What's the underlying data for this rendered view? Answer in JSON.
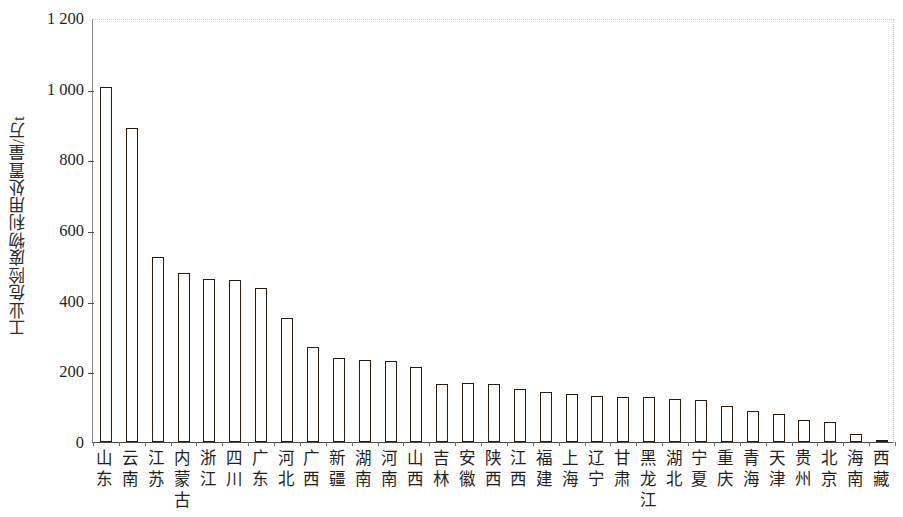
{
  "chart_data": {
    "type": "bar",
    "title": "",
    "subtitle": "",
    "xlabel": "",
    "ylabel": "工业危险废物利用处置量/万t",
    "ylim": [
      0,
      1200
    ],
    "ytick_labels": [
      "0",
      "200",
      "400",
      "600",
      "800",
      "1 000",
      "1 200"
    ],
    "ytick_values": [
      0,
      200,
      400,
      600,
      800,
      1000,
      1200
    ],
    "grid": false,
    "legend": null,
    "bar_color": "#e8933c",
    "bar_edge_color": "#2a1a0c",
    "categories": [
      "山东",
      "云南",
      "江苏",
      "内蒙古",
      "浙江",
      "四川",
      "广东",
      "河北",
      "广西",
      "新疆",
      "湖南",
      "河南",
      "山西",
      "吉林",
      "安徽",
      "陕西",
      "江西",
      "福建",
      "上海",
      "辽宁",
      "甘肃",
      "黑龙江",
      "湖北",
      "宁夏",
      "重庆",
      "青海",
      "天津",
      "贵州",
      "北京",
      "海南",
      "西藏"
    ],
    "values": [
      1005,
      890,
      525,
      478,
      462,
      458,
      435,
      352,
      270,
      238,
      232,
      230,
      212,
      165,
      167,
      165,
      150,
      141,
      135,
      130,
      128,
      126,
      122,
      120,
      101,
      88,
      80,
      63,
      56,
      22,
      7
    ]
  }
}
